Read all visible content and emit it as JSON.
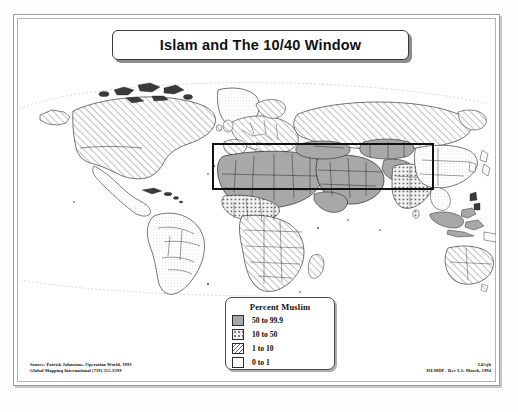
{
  "title": {
    "text": "Islam and The 10/40 Window"
  },
  "legend": {
    "title": "Percent Muslim",
    "items": [
      {
        "label": "50 to 99.9",
        "pattern": "solid-gray",
        "color": "#a8a8a8"
      },
      {
        "label": "10 to 50",
        "pattern": "dotted",
        "color": "#eeeeee"
      },
      {
        "label": "1 to 10",
        "pattern": "diagonal-hatch",
        "color": "#ffffff"
      },
      {
        "label": "0 to 1",
        "pattern": "blank",
        "color": "#ffffff"
      }
    ]
  },
  "overlay": {
    "window_1040_label": "10/40 Window"
  },
  "credits": {
    "left_line1": "Source: Patrick Johnstone, Operation World, 1993",
    "left_line2": "Global Mapping International (719) 555-3599",
    "right_line1": "Lil/sjh",
    "right_line2": "ISLMDP - Rev 3.1: March, 1994"
  },
  "map": {
    "projection_note": "world-robinson",
    "background_color": "#ffffff",
    "border_color": "#1a1a1a"
  }
}
